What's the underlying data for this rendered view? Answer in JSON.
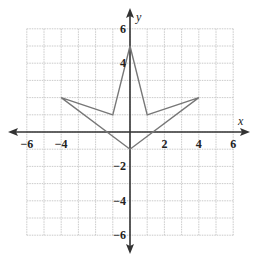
{
  "chart_data": {
    "type": "line",
    "title": "",
    "xlabel": "x",
    "ylabel": "y",
    "xlim": [
      -6,
      6
    ],
    "ylim": [
      -6,
      6
    ],
    "grid": true,
    "grid_step": 1,
    "x_ticks": [
      -6,
      -4,
      2,
      4,
      6
    ],
    "y_ticks": [
      6,
      4,
      -2,
      -4,
      -6
    ],
    "x_tick_labels": [
      "−6",
      "−4",
      "2",
      "4",
      "6"
    ],
    "y_tick_labels": [
      "6",
      "4",
      "−2",
      "−4",
      "−6"
    ],
    "series": [
      {
        "name": "polygon",
        "closed": true,
        "color": "#777777",
        "points": [
          [
            0,
            5
          ],
          [
            1,
            1
          ],
          [
            4,
            2
          ],
          [
            0,
            -1
          ],
          [
            -4,
            2
          ],
          [
            -1,
            1
          ]
        ]
      }
    ]
  },
  "colors": {
    "grid": "#bdbdbd",
    "axis": "#333333",
    "polygon": "#777777"
  }
}
